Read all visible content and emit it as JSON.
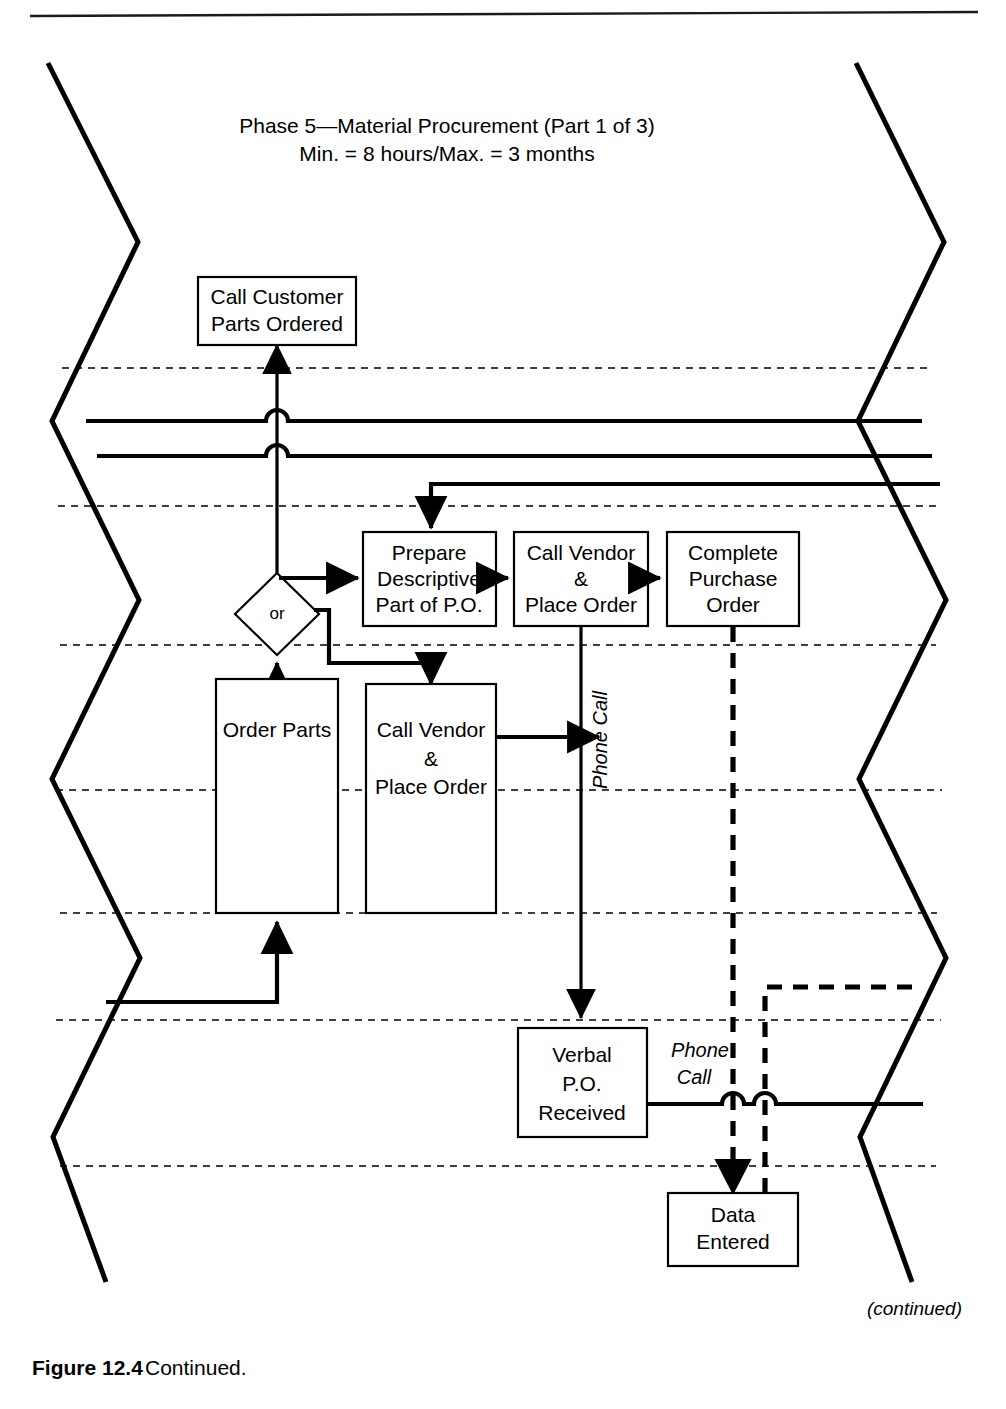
{
  "figure": {
    "title_line1": "Phase 5—Material Procurement (Part 1 of 3)",
    "title_line2": "Min. = 8 hours/Max. = 3 months",
    "caption_label": "Figure 12.4",
    "caption_text": "Continued.",
    "continued_note": "(continued)"
  },
  "nodes": {
    "call_customer": {
      "line1": "Call Customer",
      "line2": "Parts Ordered"
    },
    "prepare_po": {
      "line1": "Prepare",
      "line2": "Descriptive",
      "line3": "Part of P.O."
    },
    "call_vendor_top": {
      "line1": "Call Vendor",
      "line2": "&",
      "line3": "Place Order"
    },
    "complete_po": {
      "line1": "Complete",
      "line2": "Purchase",
      "line3": "Order"
    },
    "or_gate": {
      "label": "or"
    },
    "order_parts": {
      "line1": "Order Parts"
    },
    "call_vendor_bottom": {
      "line1": "Call Vendor",
      "line2": "&",
      "line3": "Place Order"
    },
    "verbal_po": {
      "line1": "Verbal",
      "line2": "P.O.",
      "line3": "Received"
    },
    "data_entered": {
      "line1": "Data",
      "line2": "Entered"
    }
  },
  "edge_labels": {
    "phone_call_vertical": "Phone Call",
    "phone_call_h_line1": "Phone",
    "phone_call_h_line2": "Call"
  },
  "colors": {
    "ink": "#000000",
    "paper": "#ffffff"
  }
}
